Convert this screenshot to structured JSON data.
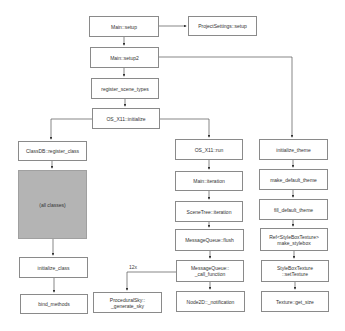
{
  "diagram": {
    "nodes": {
      "main_setup": "Main::setup",
      "project_settings_setup": "ProjectSettings::setup",
      "main_setup2": "Main::setup2",
      "register_scene_types": "register_scene_types",
      "os_x11_initialize": "OS_X11::initialize",
      "classdb_register_class": "ClassDB::register_class",
      "all_classes": "(all classes)",
      "initialize_class": "initialize_class",
      "bind_methods": "bind_methods",
      "os_x11_run": "OS_X11::run",
      "main_iteration": "Main::iteration",
      "scenetree_iteration": "SceneTree::iteration",
      "messagequeue_flush": "MessageQueue::flush",
      "messagequeue_call_function": "MessageQueue::\n_call_function",
      "proceduralsky_generate_sky": "ProceduralSky::\n_generate_sky",
      "node2d_notification": "Node2D::_notification",
      "initialize_theme": "initialize_theme",
      "make_default_theme": "make_default_theme",
      "fill_default_theme": "fill_default_theme",
      "make_stylebox": "Ref<StyleBoxTexture>\nmake_stylebox",
      "stylebox_set_texture": "StyleBoxTexture\n::setTexture",
      "texture_get_size": "Texture::get_size"
    },
    "edge_labels": {
      "call_count": "12x"
    },
    "colors": {
      "box_border": "#8a8a8a",
      "box_fill": "#ffffff",
      "highlight_fill": "#b4b4b4",
      "edge": "#555555"
    }
  }
}
